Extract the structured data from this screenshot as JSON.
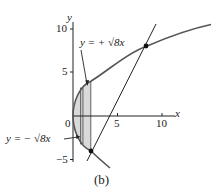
{
  "figure": {
    "caption": "(b)",
    "axes": {
      "x_label": "x",
      "y_label": "y",
      "x_ticks": [
        {
          "value": 0,
          "label": "0"
        },
        {
          "value": 5,
          "label": "5"
        },
        {
          "value": 10,
          "label": "10"
        }
      ],
      "y_ticks": [
        {
          "value": 10,
          "label": "10"
        },
        {
          "value": 5,
          "label": "5"
        },
        {
          "value": -5,
          "label": "−5"
        }
      ]
    },
    "annotations": {
      "upper_curve": "y = + √8x",
      "lower_curve": "y = − √8x"
    },
    "curves": [
      {
        "name": "upper",
        "equation": "y = +sqrt(8x)"
      },
      {
        "name": "lower",
        "equation": "y = -sqrt(8x)"
      },
      {
        "name": "line",
        "equation": "y = 2x - 8"
      }
    ],
    "intersections": [
      {
        "x": 2,
        "y": -4
      },
      {
        "x": 8,
        "y": 8
      }
    ],
    "shaded_region": {
      "x_from": 0,
      "x_to": 2
    },
    "colors": {
      "curve": "#555555",
      "shade": "#d9d9d9",
      "line": "#222222"
    }
  }
}
